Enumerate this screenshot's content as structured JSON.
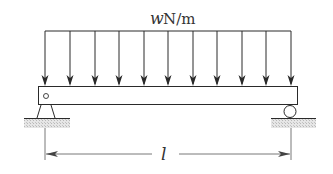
{
  "diagram": {
    "type": "simply-supported-beam",
    "load": {
      "kind": "uniformly-distributed-load",
      "symbol": "w",
      "unit": "N/m",
      "arrow_count": 11
    },
    "beam": {
      "left_support": "pin",
      "right_support": "roller"
    },
    "dimension": {
      "symbol": "l"
    },
    "colors": {
      "line": "#2a2a2a",
      "ground_hatch": "#cfcfcf",
      "background": "#ffffff"
    }
  }
}
